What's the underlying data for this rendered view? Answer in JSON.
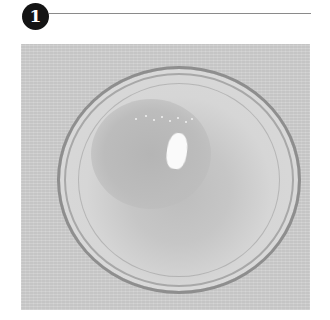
{
  "step": {
    "number": "1",
    "badge_color": "#141414",
    "rule_color": "#8a8a8a"
  },
  "photo": {
    "description": "Clear glass bowl containing a small amount of liquid, viewed from above on a light gray textured surface",
    "background_color": "#cfcfcf"
  }
}
